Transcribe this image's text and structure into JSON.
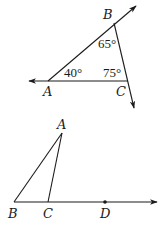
{
  "figure1": {
    "points": {
      "A": {
        "label": "A",
        "x": 48,
        "y": 81
      },
      "B": {
        "label": "B",
        "x": 114,
        "y": 23
      },
      "C": {
        "label": "C",
        "x": 128,
        "y": 81
      }
    },
    "angles": {
      "at_A": "40°",
      "at_B": "65°",
      "at_C": "75°"
    },
    "rays": [
      {
        "from": "A",
        "through": "B",
        "direction": "up-right"
      },
      {
        "from": "C",
        "through": "A",
        "direction": "left"
      },
      {
        "from": "B",
        "through": "C",
        "direction": "down-right"
      }
    ]
  },
  "figure2": {
    "points": {
      "A": {
        "label": "A",
        "x": 62,
        "y": 133
      },
      "B": {
        "label": "B",
        "x": 14,
        "y": 202
      },
      "C": {
        "label": "C",
        "x": 48,
        "y": 202
      },
      "D": {
        "label": "D",
        "x": 105,
        "y": 202
      }
    },
    "segments": [
      "AB",
      "AC"
    ],
    "rays": [
      {
        "from": "B",
        "through": "D",
        "direction": "right"
      }
    ],
    "marked_point": "D"
  },
  "colors": {
    "stroke": "#1a1a1a",
    "background": "#ffffff"
  }
}
